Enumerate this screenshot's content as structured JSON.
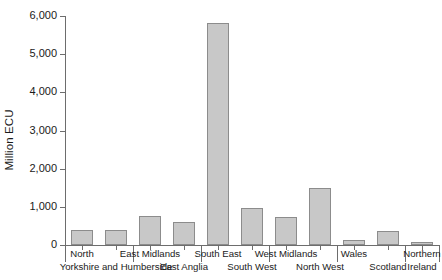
{
  "chart_data": {
    "type": "bar",
    "title": "",
    "xlabel": "",
    "ylabel": "Million ECU",
    "ylim": [
      0,
      6000
    ],
    "grid": false,
    "legend": null,
    "bar_color": "#c8c8c8",
    "bar_border_color": "#8c8c8c",
    "axis_color": "#6d6d6d",
    "y_ticks": [
      {
        "value": 0,
        "label": "0"
      },
      {
        "value": 1000,
        "label": "1,000"
      },
      {
        "value": 2000,
        "label": "2,000"
      },
      {
        "value": 3000,
        "label": "3,000"
      },
      {
        "value": 4000,
        "label": "4,000"
      },
      {
        "value": 5000,
        "label": "5,000"
      },
      {
        "value": 6000,
        "label": "6,000"
      }
    ],
    "categories": [
      "North",
      "Yorkshire and Humberside",
      "East Midlands",
      "East Anglia",
      "South East",
      "South West",
      "West Midlands",
      "North West",
      "Wales",
      "Scotland",
      "Northern Ireland"
    ],
    "values": [
      400,
      390,
      760,
      590,
      5820,
      980,
      730,
      1500,
      130,
      370,
      80
    ],
    "label_rows": [
      {
        "text": "North",
        "row": "top",
        "index": 0
      },
      {
        "text": "Yorkshire and Humberside",
        "row": "bottom",
        "index": 1
      },
      {
        "text": "East Midlands",
        "row": "top",
        "index": 2
      },
      {
        "text": "East Anglia",
        "row": "bottom",
        "index": 3
      },
      {
        "text": "South East",
        "row": "top",
        "index": 4
      },
      {
        "text": "South West",
        "row": "bottom",
        "index": 5
      },
      {
        "text": "West Midlands",
        "row": "top",
        "index": 6
      },
      {
        "text": "North West",
        "row": "bottom",
        "index": 7
      },
      {
        "text": "Wales",
        "row": "top",
        "index": 8
      },
      {
        "text": "Scotland",
        "row": "bottom",
        "index": 9
      },
      {
        "text": "Northern",
        "row": "top",
        "index": 10
      },
      {
        "text": "Ireland",
        "row": "bottom",
        "index": 10
      }
    ]
  }
}
